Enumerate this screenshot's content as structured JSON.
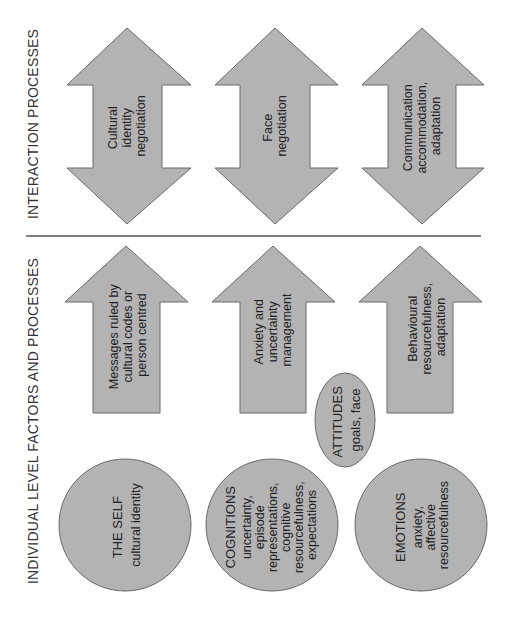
{
  "colors": {
    "shape_fill": "#b3b3b3",
    "shape_stroke": "#6a6a6a",
    "text": "#222222",
    "divider": "#555555",
    "background": "#ffffff"
  },
  "sections": {
    "interaction": {
      "label": "INTERACTION PROCESSES"
    },
    "individual": {
      "label": "INDIVIDUAL LEVEL FACTORS AND PROCESSES"
    }
  },
  "interaction_arrows": [
    {
      "type": "double-arrow",
      "lines": [
        "Cultural",
        "identity",
        "negotiation"
      ]
    },
    {
      "type": "double-arrow",
      "lines": [
        "Face",
        "negotiation"
      ]
    },
    {
      "type": "double-arrow",
      "lines": [
        "Communication",
        "accommodation,",
        "adaptation"
      ]
    }
  ],
  "individual_arrows": [
    {
      "type": "up-arrow",
      "lines": [
        "Messages ruled by",
        "cultural codes or",
        "person centred"
      ]
    },
    {
      "type": "up-arrow",
      "lines": [
        "Anxiety and",
        "uncertainty",
        "management"
      ]
    },
    {
      "type": "up-arrow",
      "lines": [
        "Behavioural",
        "resourcefulness,",
        "adaptation"
      ]
    }
  ],
  "attitudes": {
    "title": "ATTITUDES",
    "lines": [
      "goals, face"
    ]
  },
  "factors": [
    {
      "title": "THE SELF",
      "lines": [
        "cultural identity"
      ]
    },
    {
      "title": "COGNITIONS",
      "lines": [
        "uncertainty,",
        "episode",
        "representations,",
        "cognitive",
        "resourcefulness,",
        "expectations"
      ]
    },
    {
      "title": "EMOTIONS",
      "lines": [
        "anxiety,",
        "affective",
        "resourcefulness"
      ]
    }
  ]
}
